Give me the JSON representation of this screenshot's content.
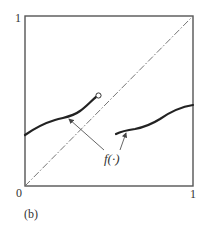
{
  "figure": {
    "panel_label": "(b)",
    "function_label": "f(·)",
    "axes": {
      "x_min_label": "0",
      "x_max_label": "1",
      "y_max_label": "1"
    },
    "colors": {
      "frame": "#555555",
      "curve": "#222222",
      "diagonal": "#666666",
      "arrow": "#555555",
      "text": "#333333"
    },
    "elements": {
      "diagonal": "45-degree dashed line y = x",
      "left_branch": "increasing curve from left edge ending in open circle",
      "right_branch": "increasing curve from interior to right edge",
      "discontinuity_marker": "open circle"
    }
  }
}
